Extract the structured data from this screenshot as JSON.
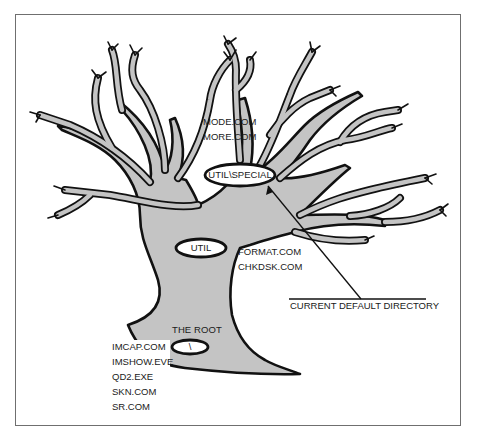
{
  "diagram": {
    "type": "directory-tree-illustration",
    "fill_color": "#c4c4c4",
    "outline_color": "#111111",
    "nodes": [
      {
        "id": "root",
        "label": "\\",
        "caption": "THE ROOT",
        "files": [
          "IMCAP.COM",
          "IMSHOW.EVE",
          "QD2.EXE",
          "SKN.COM",
          "SR.COM"
        ]
      },
      {
        "id": "util",
        "label": "UTIL",
        "files": [
          "FORMAT.COM",
          "CHKDSK.COM"
        ]
      },
      {
        "id": "util-special",
        "label": "UTIL\\SPECIAL",
        "files": [
          "MODE.COM",
          "MORE.COM"
        ]
      }
    ],
    "callout": {
      "text": "CURRENT DEFAULT DIRECTORY",
      "points_to": "util-special"
    }
  }
}
